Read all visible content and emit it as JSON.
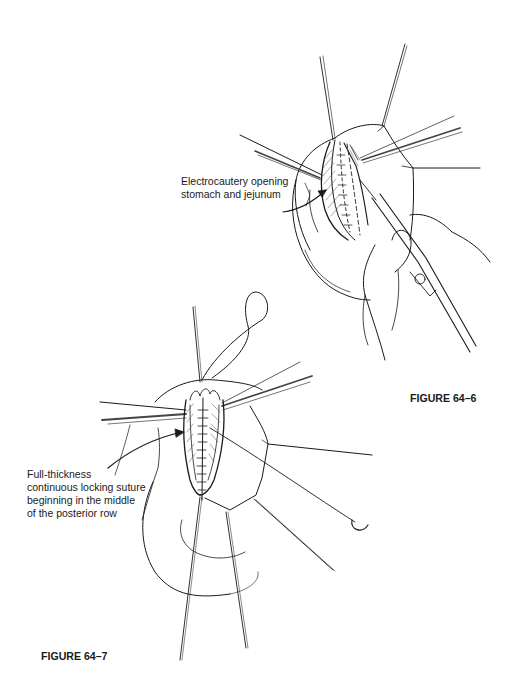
{
  "figures": [
    {
      "id": "fig-64-6",
      "caption": "FIGURE 64–6",
      "annotation": {
        "lines": [
          "Electrocautery opening",
          "stomach and jejunum"
        ]
      }
    },
    {
      "id": "fig-64-7",
      "caption": "FIGURE 64–7",
      "annotation": {
        "lines": [
          "Full-thickness",
          "continuous locking suture",
          "beginning in the middle",
          "of the posterior row"
        ]
      }
    }
  ],
  "colors": {
    "ink": "#1a1a1a",
    "background": "#ffffff",
    "hatch": "#555555"
  }
}
